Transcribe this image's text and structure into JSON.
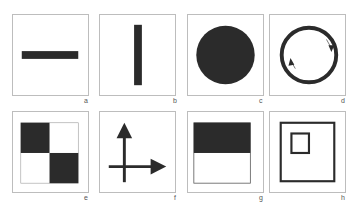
{
  "figure": {
    "fill_color": "#2b2b2b",
    "border_color": "#bdbdbd",
    "panels": [
      {
        "label": "a",
        "shape": "horizontal-bar"
      },
      {
        "label": "b",
        "shape": "vertical-bar"
      },
      {
        "label": "c",
        "shape": "filled-circle"
      },
      {
        "label": "d",
        "shape": "ring-with-rotation-arrows"
      },
      {
        "label": "e",
        "shape": "checkerboard-2x2"
      },
      {
        "label": "f",
        "shape": "axes-with-arrows"
      },
      {
        "label": "g",
        "shape": "half-filled-square"
      },
      {
        "label": "h",
        "shape": "nested-squares"
      }
    ]
  }
}
